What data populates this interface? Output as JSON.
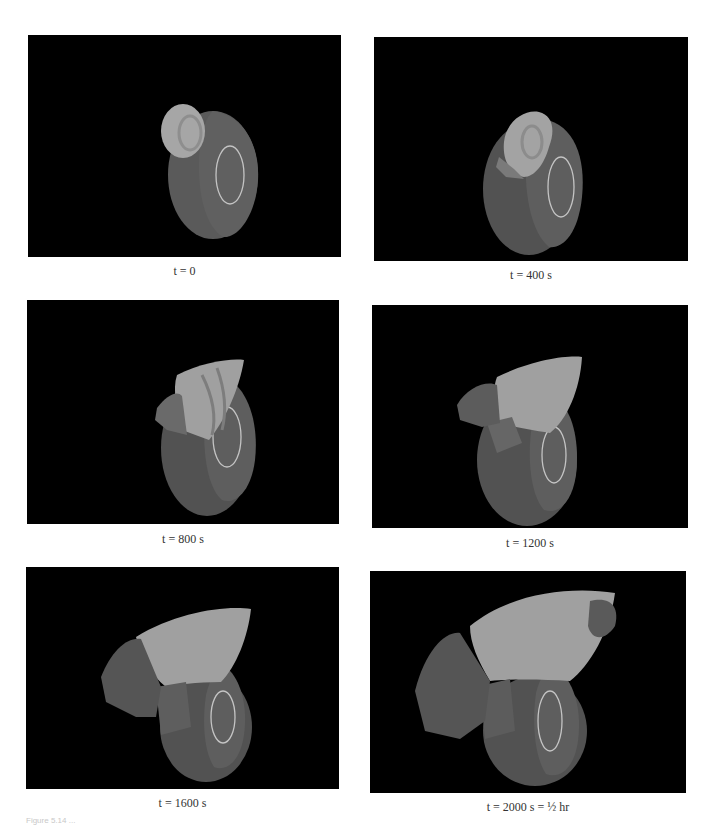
{
  "figure": {
    "panels": [
      {
        "id": "t0",
        "time_label": "t = 0",
        "var": "t",
        "value": "0"
      },
      {
        "id": "t400",
        "time_label": "t = 400 s",
        "var": "t",
        "value": "400 s"
      },
      {
        "id": "t800",
        "time_label": "t = 800 s",
        "var": "t",
        "value": "800 s"
      },
      {
        "id": "t1200",
        "time_label": "t = 1200 s",
        "var": "t",
        "value": "1200 s"
      },
      {
        "id": "t1600",
        "time_label": "t = 1600 s",
        "var": "t",
        "value": "1600 s"
      },
      {
        "id": "t2000",
        "time_label": "t = 2000 s = ½ hr",
        "var": "t",
        "value": "2000 s = ½ hr"
      }
    ],
    "caption_fragment": "Figure 5.14 ...",
    "colors": {
      "background": "#000000",
      "slab_face": "#5e5e5e",
      "slab_side": "#4a4a4a",
      "plume_light": "#a8a8a8",
      "ring": "#bdbdbd"
    }
  }
}
